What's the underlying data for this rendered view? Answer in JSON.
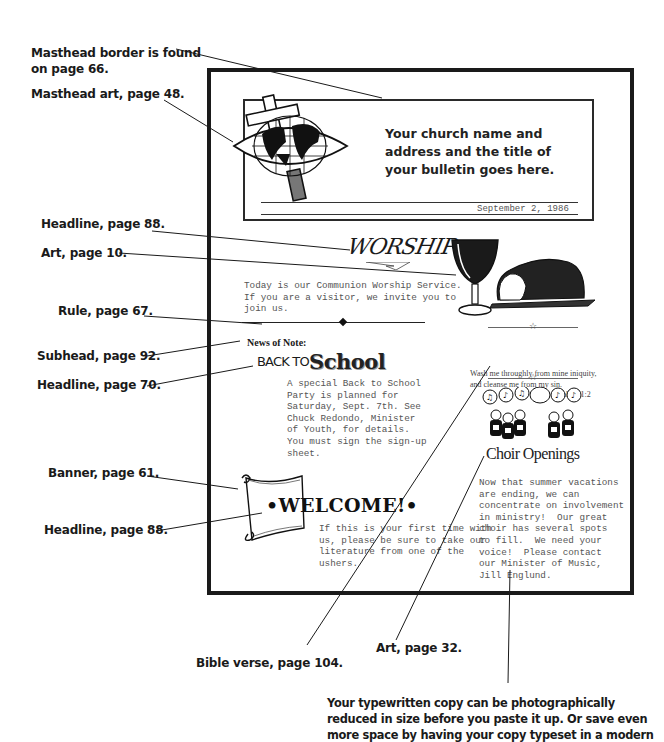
{
  "callouts": {
    "masthead_border": "Masthead border is found on page 66.",
    "masthead_art": "Masthead art, page 48.",
    "headline_worship": "Headline, page 88.",
    "art_communion": "Art, page 10.",
    "rule": "Rule, page 67.",
    "subhead": "Subhead, page 92.",
    "headline_school": "Headline, page 70.",
    "banner": "Banner, page 61.",
    "headline_welcome": "Headline, page 88.",
    "bible_verse": "Bible verse, page 104.",
    "art_choir": "Art, page 32."
  },
  "footnote": "Your typewritten copy can be photographically reduced in size before you paste it up. Or save even more space by having your copy typeset in a modern",
  "bulletin": {
    "masthead": {
      "title": "Your church name and address and the title of your bulletin goes here.",
      "date": "September 2, 1986"
    },
    "worship": {
      "headline": "WORSHIP",
      "body": "Today is our Communion Worship Service.\nIf you are a visitor, we invite you to\njoin us."
    },
    "news": {
      "subhead": "News of Note:",
      "headline_prefix": "BACK TO",
      "headline_main": "School",
      "body": "A special Back to School\nParty is planned for\nSaturday, Sept. 7th. See\nChuck Redondo, Minister\nof Youth, for details.\nYou must sign the sign-up\nsheet."
    },
    "welcome": {
      "headline": "•WELCOME!•",
      "body": "If this is your first time with\nus, please be sure to take our\nliterature from one of the\nushers."
    },
    "verse": {
      "text": "Wash me throughly from mine iniquity, and cleanse me from my sin.",
      "reference": "Psalm 51:2",
      "star": "☆"
    },
    "choir": {
      "headline": "Choir Openings",
      "body": "Now that summer vacations\nare ending, we can\nconcentrate on involvement\nin ministry!  Our great\nchoir has several spots\nto fill.  We need your\nvoice!  Please contact\nour Minister of Music,\nJill Englund."
    }
  }
}
